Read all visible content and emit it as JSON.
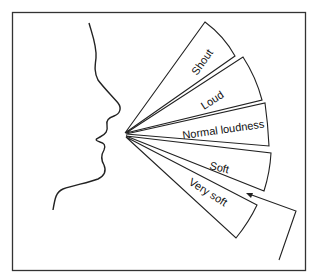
{
  "diagram": {
    "type": "voice-loudness-levels",
    "colors": {
      "line": "#222222",
      "frame": "#333333",
      "background": "#ffffff"
    },
    "levels": [
      {
        "label": "Shout"
      },
      {
        "label": "Loud"
      },
      {
        "label": "Normal loudness"
      },
      {
        "label": "Soft"
      },
      {
        "label": "Very soft"
      }
    ]
  }
}
